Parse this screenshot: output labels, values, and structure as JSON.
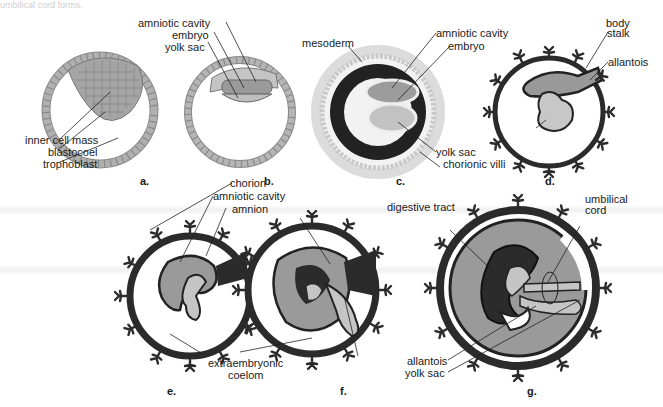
{
  "figure": {
    "caption_fragment": "umbilical cord forms.",
    "panels": [
      {
        "id": "a",
        "label": "a.",
        "labels": [
          "inner cell mass",
          "blastocoel",
          "trophoblast"
        ]
      },
      {
        "id": "b",
        "label": "b.",
        "labels": [
          "amniotic cavity",
          "embryo",
          "yolk sac"
        ]
      },
      {
        "id": "c",
        "label": "c.",
        "labels": [
          "mesoderm",
          "amniotic cavity",
          "embryo",
          "yolk sac",
          "chorionic villi"
        ]
      },
      {
        "id": "d",
        "label": "d.",
        "labels": [
          "body stalk",
          "allantois"
        ]
      },
      {
        "id": "e",
        "label": "e.",
        "labels": [
          "chorion",
          "amniotic cavity",
          "amnion",
          "extraembryonic coelom"
        ]
      },
      {
        "id": "f",
        "label": "f.",
        "labels": [
          "allantois",
          "yolk sac"
        ]
      },
      {
        "id": "g",
        "label": "g.",
        "labels": [
          "digestive tract",
          "umbilical cord"
        ]
      }
    ]
  },
  "labels": {
    "a_inner_cell_mass": "inner cell mass",
    "a_blastocoel": "blastocoel",
    "a_trophoblast": "trophoblast",
    "b_amniotic_cavity": "amniotic cavity",
    "b_embryo": "embryo",
    "b_yolk_sac": "yolk sac",
    "c_mesoderm": "mesoderm",
    "c_amniotic_cavity": "amniotic cavity",
    "c_embryo": "embryo",
    "c_yolk_sac": "yolk sac",
    "c_chorionic_villi": "chorionic villi",
    "d_body": "body",
    "d_stalk": "stalk",
    "d_allantois": "allantois",
    "e_chorion": "chorion",
    "e_amniotic_cavity": "amniotic cavity",
    "e_amnion": "amnion",
    "ef_extraembryonic": "extraembryonic",
    "ef_coelom": "coelom",
    "fg_allantois": "allantois",
    "fg_yolk_sac": "yolk sac",
    "g_digestive_tract": "digestive tract",
    "g_umbilical": "umbilical",
    "g_cord": "cord",
    "panel_a": "a.",
    "panel_b": "b.",
    "panel_c": "c.",
    "panel_d": "d.",
    "panel_e": "e.",
    "panel_f": "f.",
    "panel_g": "g."
  },
  "colors": {
    "membrane": "#2b2b2b",
    "cavity_gray": "#9a9a9a",
    "yolk_light": "#c8c8c8",
    "cell_fill": "#a8a8a8",
    "background": "#ffffff"
  }
}
